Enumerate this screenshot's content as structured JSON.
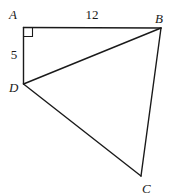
{
  "figure": {
    "type": "geometry",
    "vertices": [
      {
        "id": "A",
        "label": "A",
        "x": 23.5,
        "y": 27.5,
        "label_x": 9,
        "label_y": 19
      },
      {
        "id": "B",
        "label": "B",
        "x": 161,
        "y": 28,
        "label_x": 155,
        "label_y": 23
      },
      {
        "id": "D",
        "label": "D",
        "x": 23.5,
        "y": 84,
        "label_x": 9,
        "label_y": 92
      },
      {
        "id": "C",
        "label": "C",
        "x": 141,
        "y": 176,
        "label_x": 142,
        "label_y": 193
      }
    ],
    "edges": [
      {
        "from": "A",
        "to": "B"
      },
      {
        "from": "A",
        "to": "D"
      },
      {
        "from": "D",
        "to": "B"
      },
      {
        "from": "B",
        "to": "C"
      },
      {
        "from": "D",
        "to": "C"
      }
    ],
    "measurements": [
      {
        "edge": "AB",
        "label": "12",
        "x": 92,
        "y": 19
      },
      {
        "edge": "AD",
        "label": "5",
        "x": 14,
        "y": 59
      }
    ],
    "right_angle": {
      "at": "A",
      "size": 9
    },
    "colors": {
      "stroke": "#1a1a1a",
      "background": "#ffffff"
    }
  }
}
